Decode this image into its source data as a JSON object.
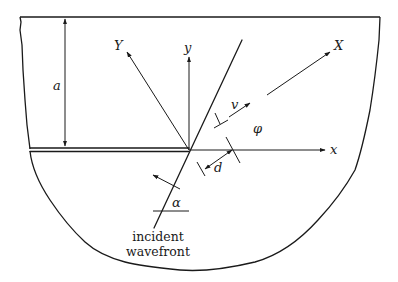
{
  "figure": {
    "labels": {
      "depth": "a",
      "rotated_x": "X",
      "rotated_y": "Y",
      "axis_x": "x",
      "axis_y": "y",
      "velocity": "v",
      "potential": "φ",
      "distance": "d",
      "angle": "α",
      "wavefront_line1": "incident",
      "wavefront_line2": "wavefront"
    },
    "colors": {
      "ink": "#1a1a1a",
      "background": "#ffffff"
    }
  }
}
